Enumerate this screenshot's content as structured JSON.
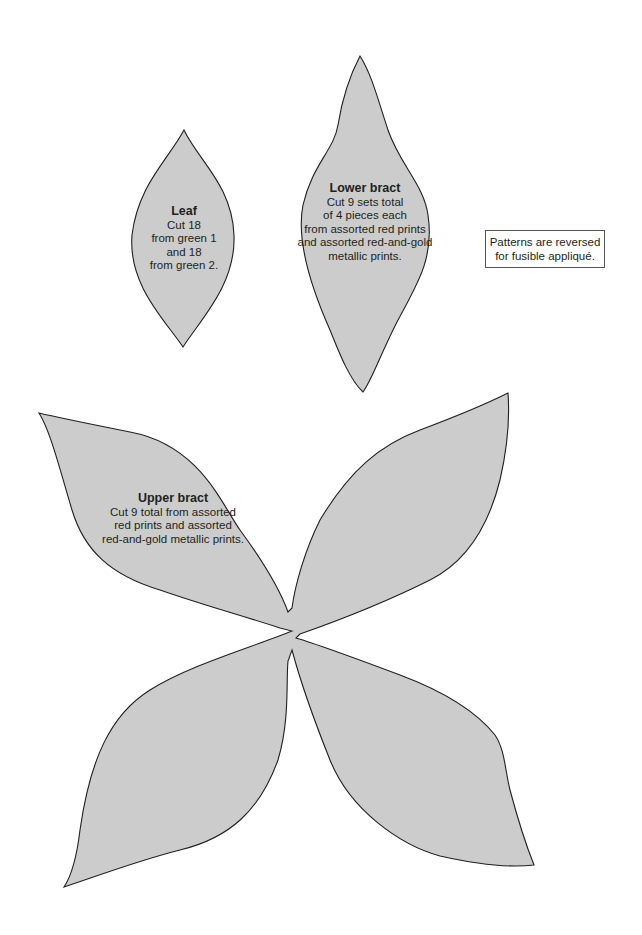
{
  "pieces": {
    "leaf": {
      "title": "Leaf",
      "lines": [
        "Cut 18",
        "from green 1",
        "and 18",
        "from green 2."
      ]
    },
    "lower_bract": {
      "title": "Lower bract",
      "lines": [
        "Cut 9 sets total",
        "of 4 pieces each",
        "from assorted red prints",
        "and assorted red-and-gold",
        "metallic prints."
      ]
    },
    "upper_bract": {
      "title": "Upper bract",
      "lines": [
        "Cut 9 total from assorted",
        "red prints and assorted",
        "red-and-gold metallic prints."
      ]
    }
  },
  "note": {
    "lines": [
      "Patterns are reversed",
      "for fusible appliqué."
    ]
  },
  "colors": {
    "fill": "#cccccc",
    "outline": "#231f20"
  }
}
